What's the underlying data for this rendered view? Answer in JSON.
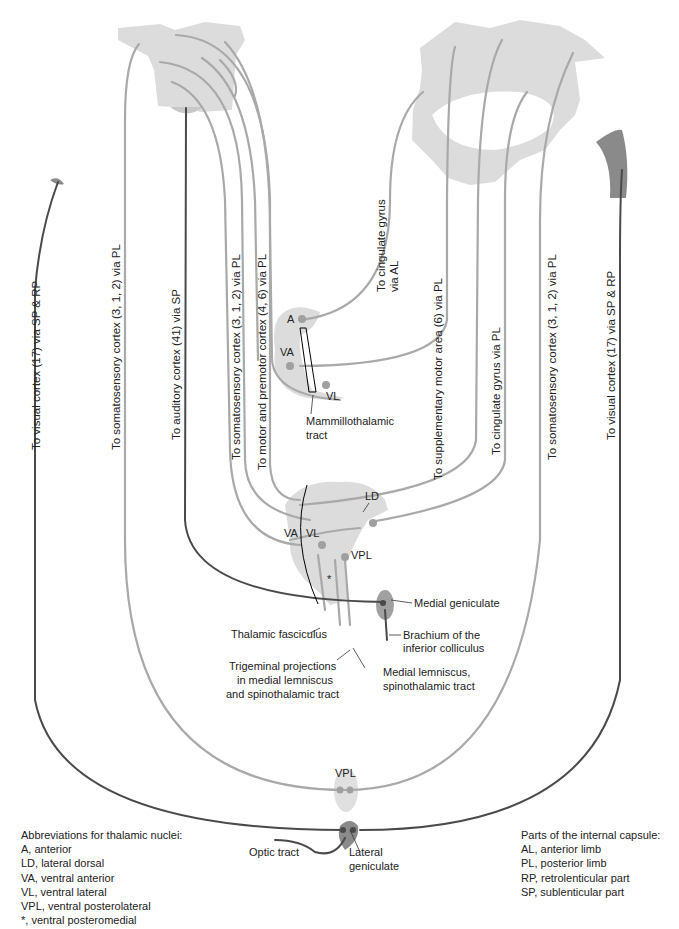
{
  "colors": {
    "tract_light": "#a9a9a9",
    "tract_dark": "#4a4a4a",
    "region_fill": "#dcdcdc",
    "region_dark": "#8a8a8a",
    "text": "#222222"
  },
  "cortex_labels": {
    "visual_left": "To visual cortex (17) via SP & RP",
    "somatosensory_left": "To somatosensory cortex (3, 1, 2) via PL",
    "auditory": "To auditory cortex (41) via SP",
    "somatosensory_mid": "To somatosensory cortex (3, 1, 2) via PL",
    "motor_premotor": "To motor and premotor cortex (4, 6) via PL",
    "cingulate_al_line1": "To cingulate gyrus",
    "cingulate_al_line2": "via AL",
    "supplementary_motor": "To supplementary motor area (6) via PL",
    "cingulate_pl": "To cingulate gyrus via PL",
    "somatosensory_right": "To somatosensory cortex (3, 1, 2) via PL",
    "visual_right": "To visual cortex (17) via SP & RP"
  },
  "nuclei_labels": {
    "upper_A": "A",
    "upper_VA": "VA",
    "upper_VL": "VL",
    "mid_LD": "LD",
    "mid_VA": "VA",
    "mid_VL": "VL",
    "mid_VPL": "VPL",
    "lower_VPL": "VPL"
  },
  "structure_labels": {
    "mammillothalamic_line1": "Mammillothalamic",
    "mammillothalamic_line2": "tract",
    "medial_geniculate": "Medial geniculate",
    "brachium_line1": "Brachium of the",
    "brachium_line2": "inferior colliculus",
    "thalamic_fasciculus": "Thalamic fasciculus",
    "trigeminal_line1": "Trigeminal projections",
    "trigeminal_line2": "in medial lemniscus",
    "trigeminal_line3": "and spinothalamic tract",
    "medial_lemniscus_line1": "Medial lemniscus,",
    "medial_lemniscus_line2": "spinothalamic tract",
    "optic_tract": "Optic tract",
    "lateral_geniculate_line1": "Lateral",
    "lateral_geniculate_line2": "geniculate"
  },
  "legend_nuclei": {
    "title": "Abbreviations for thalamic nuclei:",
    "items": [
      "A, anterior",
      "LD, lateral dorsal",
      "VA, ventral anterior",
      "VL, ventral lateral",
      "VPL, ventral posterolateral",
      "*, ventral posteromedial"
    ]
  },
  "legend_capsule": {
    "title": "Parts of the internal capsule:",
    "items": [
      "AL, anterior limb",
      "PL, posterior limb",
      "RP, retrolenticular part",
      "SP, sublenticular part"
    ]
  }
}
